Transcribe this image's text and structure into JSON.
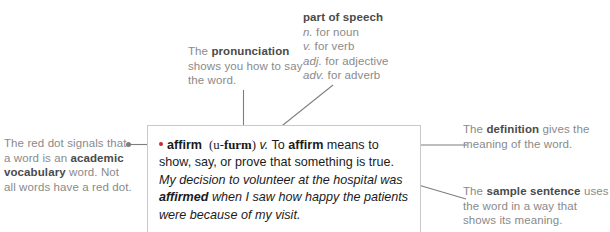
{
  "graphic": {
    "title": "Anatomy of a dictionary entry",
    "accent_color": "#d0242c",
    "callout_text_color": "#8a8a8a",
    "callout_bold_color": "#4a4a4a",
    "entry_text_color": "#1b1b1b",
    "leader_line_color": "#7d7d7d",
    "box_border_color": "#c9c9c9"
  },
  "callouts": {
    "pronunciation": {
      "lead": "The ",
      "bold": "pronunciation",
      "rest": " shows you how to say the word."
    },
    "part_of_speech": {
      "heading": "part of speech",
      "abbreviations": [
        {
          "abbr": "n.",
          "expansion": " for noun"
        },
        {
          "abbr": "v.",
          "expansion": " for verb"
        },
        {
          "abbr": "adj.",
          "expansion": " for adjective"
        },
        {
          "abbr": "adv.",
          "expansion": " for adverb"
        }
      ]
    },
    "red_dot": {
      "lead": "The red dot signals that a word is an ",
      "bold": "academic vocabulary",
      "rest": " word. Not all words have a red dot."
    },
    "definition": {
      "lead": "The ",
      "bold": "definition",
      "rest": " gives the meaning of the word."
    },
    "sample_sentence": {
      "lead": "The ",
      "bold": "sample sentence",
      "rest": " uses the word in a way that shows its meaning."
    }
  },
  "entry": {
    "headword": "affirm",
    "pronunciation_open": "(u-",
    "pronunciation_stress": "furm",
    "pronunciation_close": ")",
    "part_of_speech": "v.",
    "definition_lead": " To ",
    "definition_word": "affirm",
    "definition_rest": " means to show, say, or prove that something is true.",
    "sample_lead": "My decision to volunteer at the hospital was ",
    "sample_bold": "affirmed",
    "sample_rest": " when I saw how happy the patients were because of my visit."
  }
}
